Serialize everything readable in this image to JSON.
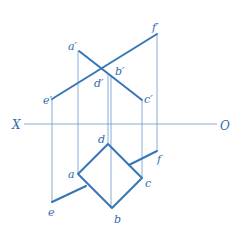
{
  "diagram": {
    "colors": {
      "thick_line": "#3776b6",
      "thin_line": "#6a98cc",
      "label": "#2f6cae",
      "background": "#ffffff"
    },
    "axis": {
      "left_label": "X",
      "right_label": "O",
      "y": 124,
      "x1": 24,
      "x2": 217
    },
    "front_view": {
      "labels": {
        "a": "a′",
        "b": "b′",
        "c": "c′",
        "d": "d′",
        "e": "e′",
        "f": "f′"
      },
      "points": {
        "a": [
          79,
          51
        ],
        "c": [
          142,
          100
        ],
        "e": [
          52,
          99
        ],
        "f": [
          157,
          34
        ],
        "bd": [
          103,
          68
        ]
      }
    },
    "top_view": {
      "labels": {
        "a": "a",
        "b": "b",
        "c": "c",
        "d": "d",
        "e": "e",
        "f": "f"
      },
      "points": {
        "a": [
          78,
          174
        ],
        "b": [
          112,
          208
        ],
        "c": [
          142,
          178
        ],
        "d": [
          108,
          144
        ],
        "e": [
          52,
          202
        ],
        "f": [
          157,
          151
        ],
        "e_join": [
          86,
          186
        ],
        "f_join": [
          129,
          165
        ]
      }
    }
  }
}
